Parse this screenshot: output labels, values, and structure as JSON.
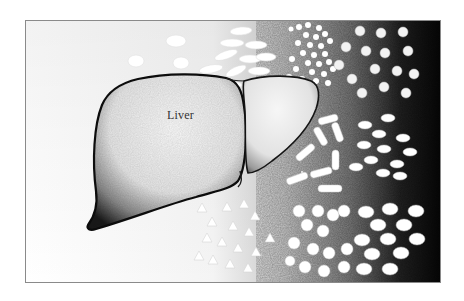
{
  "illustration": {
    "subject": "liver",
    "label": "Liver",
    "elements": [
      {
        "type": "capsules",
        "region": "upper-center",
        "shade": "faint"
      },
      {
        "type": "small-round-pills",
        "region": "upper-right",
        "shade": "white-on-gray"
      },
      {
        "type": "round-tablets",
        "region": "top-right-edge",
        "shade": "white-on-black"
      },
      {
        "type": "split-capsules",
        "region": "center-right",
        "shade": "white-on-gray"
      },
      {
        "type": "oval-tablets",
        "region": "right",
        "shade": "white-on-black"
      },
      {
        "type": "triangle-tablets",
        "region": "bottom-center",
        "shade": "faint"
      },
      {
        "type": "round-pills",
        "region": "bottom-right",
        "shade": "white-on-gray"
      }
    ],
    "colors": {
      "background_light": "#ffffff",
      "background_dark": "#0a0a0a",
      "liver_outline": "#111111",
      "frame_border": "#8a8a8a"
    }
  }
}
